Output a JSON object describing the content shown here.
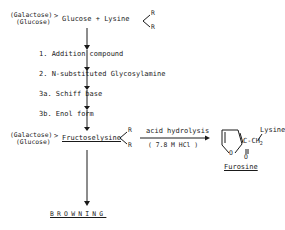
{
  "diagram": {
    "start": {
      "sugar_top": "(Galactose)",
      "sugar_bottom": "(Glucose)",
      "reactant": "Glucose + Lysine",
      "r_top": "R",
      "r_bottom": "R"
    },
    "steps": [
      {
        "label": "1. Addition compound"
      },
      {
        "label": "2. N-substituted Glycosylamine"
      },
      {
        "label": "3a. Schiff base"
      },
      {
        "label": "3b. Enol form"
      }
    ],
    "product": {
      "sugar_top": "(Galactose)",
      "sugar_bottom": "(Glucose)",
      "name": "Fructoselysine",
      "r_top": "R",
      "r_bottom": "R"
    },
    "hydrolysis": {
      "label": "acid hydrolysis",
      "condition": "( 7.8 M HCl )"
    },
    "furosine": {
      "name": "Furosine",
      "lysine": "Lysine",
      "side_chain": "C-CH",
      "subscript": "2",
      "ring_o": "O",
      "carbonyl_o": "O"
    },
    "end": {
      "label": "BROWNING"
    }
  }
}
